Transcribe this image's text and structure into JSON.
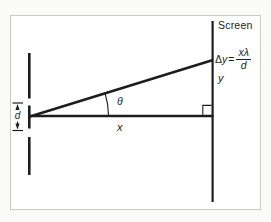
{
  "figure": {
    "screen_label": "Screen",
    "equation": {
      "delta": "Δ",
      "lhs": "y",
      "equals": "=",
      "numerator": "xλ",
      "denominator": "d"
    },
    "labels": {
      "y": "y",
      "x": "x",
      "theta": "θ",
      "d": "d"
    }
  },
  "colors": {
    "line": "#1d1d1d",
    "panel_border": "#c9c9c9",
    "panel_bg": "#ffffff",
    "page_bg": "#fafaf8"
  }
}
